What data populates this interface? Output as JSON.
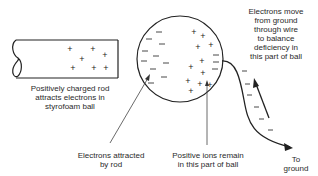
{
  "labels": {
    "rod": [
      "Positively charged rod",
      "attracts electrons in",
      "styrofoam ball"
    ],
    "electrons_attracted": [
      "Electrons attracted",
      "by rod"
    ],
    "positive_ions": [
      "Positive ions remain",
      "in this part of ball"
    ],
    "electrons_move": [
      "Electrons move",
      "from ground",
      "through wire",
      "to balance",
      "deficiency in",
      "this part of ball"
    ],
    "ground": [
      "To",
      "ground"
    ]
  },
  "symbols": {
    "plus": "+",
    "minus": "–"
  },
  "colors": {
    "stroke": "#222222",
    "text": "#2a2a2a",
    "background": "#ffffff"
  }
}
